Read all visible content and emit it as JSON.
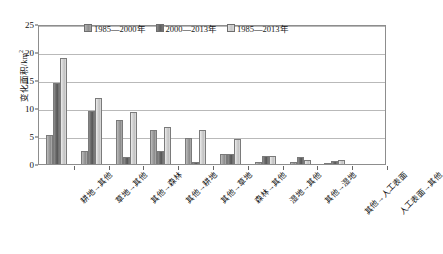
{
  "chart_data": {
    "type": "bar",
    "title": "",
    "xlabel": "",
    "ylabel": "变化面积/km²",
    "ylim": [
      0,
      25
    ],
    "yticks": [
      0,
      5,
      10,
      15,
      20,
      25
    ],
    "grid": true,
    "legend_position": "top-center",
    "categories": [
      "耕地→其他",
      "草地→其他",
      "其他→森林",
      "其他→耕地",
      "其他→草地",
      "森林→其他",
      "湿地→其他",
      "其他→湿地",
      "其他→人工表面",
      "人工表面→其他"
    ],
    "series": [
      {
        "name": "1985—2000年",
        "color": "#9a9a9a",
        "values": [
          5.1,
          2.4,
          7.9,
          6.0,
          4.6,
          1.8,
          0.3,
          0.3,
          0.1,
          0.0
        ]
      },
      {
        "name": "2000—2013年",
        "color": "#636363",
        "values": [
          14.4,
          9.4,
          1.3,
          2.4,
          0.4,
          1.8,
          1.5,
          1.2,
          0.6,
          0.0
        ]
      },
      {
        "name": "1985—2013年",
        "color": "#cdcdcd",
        "values": [
          19.0,
          11.7,
          9.2,
          6.6,
          6.1,
          4.4,
          1.4,
          0.8,
          0.7,
          0.0
        ]
      }
    ]
  },
  "axis": {
    "y_title_main": "变化面积/km",
    "y_title_sup": "2"
  }
}
